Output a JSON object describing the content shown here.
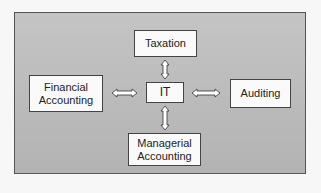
{
  "diagram": {
    "center": {
      "label": "IT"
    },
    "nodes": {
      "top": {
        "label": "Taxation"
      },
      "left": {
        "label": "Financial Accounting",
        "line1": "Financial",
        "line2": "Accounting"
      },
      "right": {
        "label": "Auditing"
      },
      "bottom": {
        "label": "Managerial Accounting",
        "line1": "Managerial",
        "line2": "Accounting"
      }
    },
    "edges": [
      {
        "from": "IT",
        "to": "Taxation",
        "type": "bidirectional"
      },
      {
        "from": "IT",
        "to": "Financial Accounting",
        "type": "bidirectional"
      },
      {
        "from": "IT",
        "to": "Auditing",
        "type": "bidirectional"
      },
      {
        "from": "IT",
        "to": "Managerial Accounting",
        "type": "bidirectional"
      }
    ],
    "colors": {
      "panel": "#b9b9b9",
      "box": "#fafafa",
      "border": "#444444"
    }
  }
}
